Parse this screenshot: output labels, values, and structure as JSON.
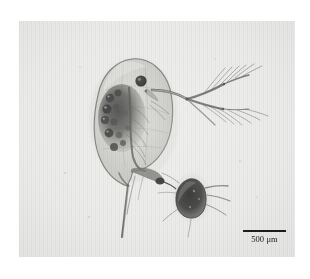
{
  "figure": {
    "kind": "light-microscopy-photograph"
  },
  "scalebar": {
    "label": "500 μm",
    "value": "500",
    "unit": "μm",
    "bar_length_px": "43",
    "color": "#1d1d1d"
  },
  "palette": {
    "page_background": "#ffffff",
    "photo_background": "#e9e9e7",
    "ink_dark": "#1d1d1d",
    "tissue_mid": "#8d8d88",
    "tissue_light": "#c9c9c4"
  },
  "organisms": [
    {
      "name": "daphnia",
      "common_name": "water flea",
      "position": "center-left",
      "features": [
        "translucent oval carapace",
        "dark compound eye",
        "branched biramous swimming antennae with setae",
        "mottled dark brood chamber and gut",
        "long caudal tail spine"
      ]
    },
    {
      "name": "small-zooplankter",
      "common_name": "juvenile cladoceran",
      "position": "lower-right",
      "features": [
        "dark opaque body",
        "short antennae with setae"
      ]
    }
  ]
}
